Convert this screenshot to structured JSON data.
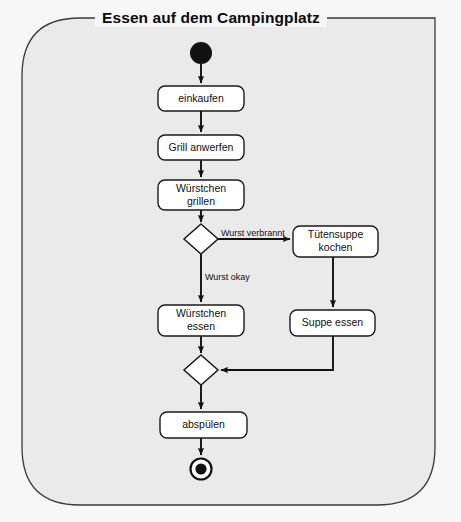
{
  "diagram": {
    "title": "Essen auf dem Campingplatz",
    "type": "uml-activity-diagram",
    "frame": {
      "x": 22,
      "y": 18,
      "width": 413,
      "height": 487,
      "corner_radius": 58,
      "fill": "#eaeaea",
      "stroke": "#333333"
    },
    "colors": {
      "background": "#f7f7f7",
      "frame_fill": "#eaeaea",
      "node_fill": "#ffffff",
      "stroke": "#1a1a1a",
      "text": "#111111"
    },
    "nodes": [
      {
        "id": "start",
        "kind": "initial-node",
        "label": "",
        "cx": 201,
        "cy": 53,
        "r": 11
      },
      {
        "id": "einkaufen",
        "kind": "action",
        "label": "einkaufen",
        "x": 158,
        "y": 86,
        "width": 86,
        "height": 25
      },
      {
        "id": "grill-anwerfen",
        "kind": "action",
        "label": "Grill anwerfen",
        "x": 158,
        "y": 135,
        "width": 86,
        "height": 25
      },
      {
        "id": "wuerstchen-grillen",
        "kind": "action",
        "label": "Würstchen\ngrillen",
        "x": 158,
        "y": 180,
        "width": 86,
        "height": 30
      },
      {
        "id": "decision",
        "kind": "decision-node",
        "label": "",
        "cx": 201,
        "cy": 239,
        "half_width": 17,
        "half_height": 15
      },
      {
        "id": "tuetensuppe-kochen",
        "kind": "action",
        "label": "Tütensuppe\nkochen",
        "x": 293,
        "y": 226,
        "width": 85,
        "height": 31
      },
      {
        "id": "wuerstchen-essen",
        "kind": "action",
        "label": "Würstchen\nessen",
        "x": 158,
        "y": 305,
        "width": 86,
        "height": 31
      },
      {
        "id": "suppe-essen",
        "kind": "action",
        "label": "Suppe essen",
        "x": 290,
        "y": 310,
        "width": 85,
        "height": 26
      },
      {
        "id": "merge",
        "kind": "merge-node",
        "label": "",
        "cx": 201,
        "cy": 370,
        "half_width": 17,
        "half_height": 15
      },
      {
        "id": "abspuelen",
        "kind": "action",
        "label": "abspülen",
        "x": 160,
        "y": 412,
        "width": 87,
        "height": 26
      },
      {
        "id": "end",
        "kind": "final-node",
        "label": "",
        "cx": 201,
        "cy": 469,
        "r_outer": 11,
        "r_inner": 6
      }
    ],
    "edges": [
      {
        "id": "e-start-einkaufen",
        "from": "start",
        "to": "einkaufen",
        "label": ""
      },
      {
        "id": "e-einkaufen-grill",
        "from": "einkaufen",
        "to": "grill-anwerfen",
        "label": ""
      },
      {
        "id": "e-grill-grillen",
        "from": "grill-anwerfen",
        "to": "wuerstchen-grillen",
        "label": ""
      },
      {
        "id": "e-grillen-decision",
        "from": "wuerstchen-grillen",
        "to": "decision",
        "label": ""
      },
      {
        "id": "e-decision-suppe",
        "from": "decision",
        "to": "tuetensuppe-kochen",
        "label": "Wurst verbrannt"
      },
      {
        "id": "e-decision-essen",
        "from": "decision",
        "to": "wuerstchen-essen",
        "label": "Wurst okay"
      },
      {
        "id": "e-kochen-suppeessen",
        "from": "tuetensuppe-kochen",
        "to": "suppe-essen",
        "label": ""
      },
      {
        "id": "e-essen-merge",
        "from": "wuerstchen-essen",
        "to": "merge",
        "label": ""
      },
      {
        "id": "e-suppeessen-merge",
        "from": "suppe-essen",
        "to": "merge",
        "label": ""
      },
      {
        "id": "e-merge-abspuelen",
        "from": "merge",
        "to": "abspuelen",
        "label": ""
      },
      {
        "id": "e-abspuelen-end",
        "from": "abspuelen",
        "to": "end",
        "label": ""
      }
    ],
    "edge_labels": {
      "wurst_verbrannt": "Wurst verbrannt",
      "wurst_okay": "Wurst okay"
    }
  }
}
